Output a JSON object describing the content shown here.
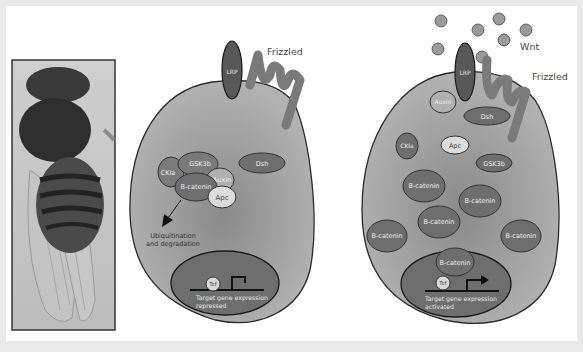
{
  "figure": {
    "photo": {
      "subject": "fruit-fly"
    },
    "left_cell": {
      "state": "Wnt off",
      "receptors": {
        "lrp": "LRP",
        "frizzled": "Frizzled"
      },
      "complex": {
        "gsk3b": "GSK3b",
        "ckia": "CKIa",
        "auxin": "Auxin",
        "bcatenin": "B-catenin",
        "apc": "Apc"
      },
      "dsh": "Dsh",
      "arrow_label_1": "Ubiquitination",
      "arrow_label_2": "and degradation",
      "nucleus": {
        "tcf": "Tcf",
        "caption_1": "Target gene expression",
        "caption_2": "repressed"
      }
    },
    "right_cell": {
      "state": "Wnt on",
      "ligand": "Wnt",
      "receptors": {
        "lrp": "LRP",
        "frizzled": "Frizzled"
      },
      "auxin": "Auxin",
      "dsh": "Dsh",
      "ckia": "CKIa",
      "apc": "Apc",
      "gsk3b": "GSK3b",
      "bcatenin": [
        "B-catenin",
        "B-catenin",
        "B-catenin",
        "B-catenin",
        "B-catenin"
      ],
      "nucleus": {
        "bcatenin": "B-catenin",
        "tcf": "Tcf",
        "caption_1": "Target gene expression",
        "caption_2": "activated"
      }
    },
    "colors": {
      "cell_fill": "#a9a9a9",
      "cell_center": "#8c8c8c",
      "protein_dark": "#6e6e6e",
      "protein_light": "#d9d9d9",
      "lrp": "#585858",
      "frizzled": "#7a7a7a",
      "wnt": "#9a9a9a",
      "outline": "#2b2b2b"
    }
  }
}
